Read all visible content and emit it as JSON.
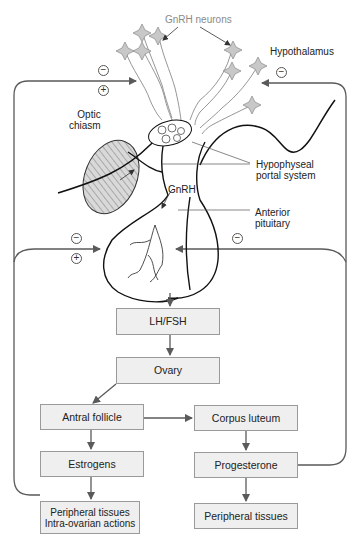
{
  "labels": {
    "gnrh_neurons": "GnRH neurons",
    "hypothalamus": "Hypothalamus",
    "optic_chiasm_line1": "Optic",
    "optic_chiasm_line2": "chiasm",
    "hypophyseal_line1": "Hypophyseal",
    "hypophyseal_line2": "portal system",
    "gnrh": "GnRH",
    "anterior_line1": "Anterior",
    "anterior_line2": "pituitary"
  },
  "feedback_signs": {
    "hypothalamus_left_top": "−",
    "hypothalamus_left_bottom": "+",
    "hypothalamus_right": "−",
    "pituitary_left_top": "−",
    "pituitary_left_bottom": "+",
    "pituitary_right": "−"
  },
  "boxes": {
    "lh_fsh": "LH/FSH",
    "ovary": "Ovary",
    "antral_follicle": "Antral follicle",
    "corpus_luteum": "Corpus luteum",
    "estrogens": "Estrogens",
    "progesterone": "Progesterone",
    "peripheral_left_line1": "Peripheral tissues",
    "peripheral_left_line2": "Intra-ovarian actions",
    "peripheral_right": "Peripheral tissues"
  },
  "colors": {
    "box_fill": "#efefef",
    "box_border": "#9a9a9a",
    "arrow": "#5a5a5a",
    "neuron_fill": "#c8c8c8",
    "neuron_label": "#8a8a8a"
  }
}
